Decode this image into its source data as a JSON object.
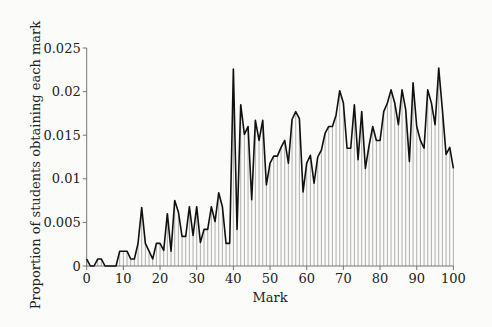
{
  "chart_data": {
    "type": "line",
    "style": "line with vertical stems to x-axis at each integer mark",
    "title": "",
    "xlabel": "Mark",
    "ylabel": "Proportion of students obtaining each mark",
    "xlim": [
      0,
      100
    ],
    "ylim": [
      0,
      0.025
    ],
    "x_ticks": [
      0,
      10,
      20,
      30,
      40,
      50,
      60,
      70,
      80,
      90,
      100
    ],
    "x_tick_labels": [
      "0",
      "10",
      "20",
      "30",
      "40",
      "50",
      "60",
      "70",
      "80",
      "90",
      "100"
    ],
    "y_ticks": [
      0,
      0.005,
      0.01,
      0.015,
      0.02,
      0.025
    ],
    "y_tick_labels": [
      "0",
      "0.005",
      "0.01",
      "0.015",
      "0.02",
      "0.025"
    ],
    "grid": false,
    "legend": null,
    "x": [
      0,
      1,
      2,
      3,
      4,
      5,
      6,
      7,
      8,
      9,
      10,
      11,
      12,
      13,
      14,
      15,
      16,
      17,
      18,
      19,
      20,
      21,
      22,
      23,
      24,
      25,
      26,
      27,
      28,
      29,
      30,
      31,
      32,
      33,
      34,
      35,
      36,
      37,
      38,
      39,
      40,
      41,
      42,
      43,
      44,
      45,
      46,
      47,
      48,
      49,
      50,
      51,
      52,
      53,
      54,
      55,
      56,
      57,
      58,
      59,
      60,
      61,
      62,
      63,
      64,
      65,
      66,
      67,
      68,
      69,
      70,
      71,
      72,
      73,
      74,
      75,
      76,
      77,
      78,
      79,
      80,
      81,
      82,
      83,
      84,
      85,
      86,
      87,
      88,
      89,
      90,
      91,
      92,
      93,
      94,
      95,
      96,
      97,
      98,
      99,
      100
    ],
    "values": [
      0.0008,
      0,
      0,
      0.0008,
      0.0008,
      0,
      0,
      0,
      0,
      0.0017,
      0.0017,
      0.0017,
      0.0008,
      0.0008,
      0.0026,
      0.0067,
      0.0026,
      0.0017,
      0.0008,
      0.0026,
      0.0026,
      0.0018,
      0.006,
      0.0017,
      0.0075,
      0.0062,
      0.0034,
      0.0034,
      0.0068,
      0.0035,
      0.0068,
      0.0027,
      0.0042,
      0.0042,
      0.0068,
      0.0051,
      0.0084,
      0.0068,
      0.0026,
      0.0026,
      0.0226,
      0.0042,
      0.0185,
      0.0151,
      0.016,
      0.0076,
      0.0167,
      0.0144,
      0.0167,
      0.0093,
      0.0118,
      0.0126,
      0.0126,
      0.0136,
      0.0144,
      0.0118,
      0.0168,
      0.0177,
      0.0169,
      0.0085,
      0.0118,
      0.0127,
      0.0095,
      0.0125,
      0.0133,
      0.0152,
      0.016,
      0.016,
      0.0173,
      0.0201,
      0.0187,
      0.0135,
      0.0135,
      0.0185,
      0.0122,
      0.0177,
      0.0112,
      0.0138,
      0.016,
      0.0144,
      0.0144,
      0.0177,
      0.0187,
      0.0202,
      0.0187,
      0.0162,
      0.0202,
      0.0179,
      0.012,
      0.021,
      0.016,
      0.0144,
      0.0135,
      0.0202,
      0.0187,
      0.0162,
      0.0227,
      0.0179,
      0.0128,
      0.0136,
      0.0112
    ]
  },
  "colors": {
    "background": "#fbfbfa",
    "line": "#111111",
    "stems": "#9a9a9a",
    "axes": "#777777",
    "text": "#222222"
  }
}
